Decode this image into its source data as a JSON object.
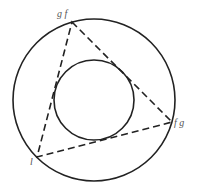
{
  "diagram": {
    "outer_circle": {
      "cx": 94,
      "cy": 100,
      "r": 81
    },
    "inner_circle": {
      "cx": 94,
      "cy": 100,
      "r": 40
    },
    "triangle": {
      "vertices": [
        {
          "x": 72,
          "y": 22,
          "label": "g f"
        },
        {
          "x": 172,
          "y": 122,
          "label": "f g"
        },
        {
          "x": 37,
          "y": 157,
          "label": "l"
        }
      ],
      "style": "dashed"
    },
    "colors": {
      "stroke": "#222222",
      "label": "#555555"
    }
  }
}
